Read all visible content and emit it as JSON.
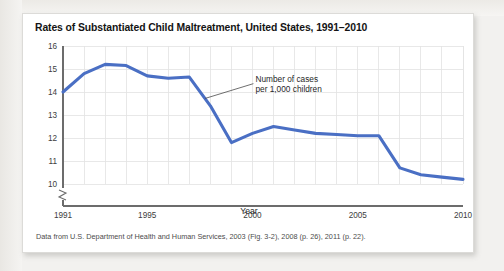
{
  "card": {
    "title": "Rates of Substantiated Child Maltreatment, United States, 1991–2010",
    "source_note": "Data from U.S. Department of Health and Human Services, 2003 (Fig. 3-2), 2008 (p. 26), 2011 (p. 22).",
    "line_color": "#4a6fc4",
    "background": "#ffffff"
  },
  "chart_data": {
    "type": "line",
    "title": "Rates of Substantiated Child Maltreatment, United States, 1991–2010",
    "xlabel": "Year",
    "ylabel": "",
    "annotation": "Number of cases per 1,000 children",
    "annotation_line1": "Number of cases",
    "annotation_line2": "per 1,000 children",
    "xlim": [
      1991,
      2010
    ],
    "ylim": [
      9.6,
      16
    ],
    "y_axis_break": true,
    "grid": true,
    "legend": "none",
    "y_ticks": [
      "16",
      "15",
      "14",
      "13",
      "12",
      "11",
      "10"
    ],
    "y_tick_values": [
      16,
      15,
      14,
      13,
      12,
      11,
      10
    ],
    "x_ticks": [
      "1991",
      "1995",
      "2000",
      "2005",
      "2010"
    ],
    "x_tick_values": [
      1991,
      1995,
      2000,
      2005,
      2010
    ],
    "x": [
      1991,
      1992,
      1993,
      1994,
      1995,
      1996,
      1997,
      1998,
      1999,
      2000,
      2001,
      2002,
      2003,
      2004,
      2005,
      2006,
      2007,
      2008,
      2009,
      2010
    ],
    "values": [
      14.0,
      14.8,
      15.2,
      15.15,
      14.7,
      14.6,
      14.65,
      13.4,
      11.8,
      12.2,
      12.5,
      12.35,
      12.2,
      12.15,
      12.1,
      12.1,
      10.7,
      10.4,
      10.3,
      10.2
    ],
    "series": [
      {
        "name": "Number of cases per 1,000 children",
        "color": "#4a6fc4",
        "values": [
          14.0,
          14.8,
          15.2,
          15.15,
          14.7,
          14.6,
          14.65,
          13.4,
          11.8,
          12.2,
          12.5,
          12.35,
          12.2,
          12.15,
          12.1,
          12.1,
          10.7,
          10.4,
          10.3,
          10.2
        ]
      }
    ]
  }
}
